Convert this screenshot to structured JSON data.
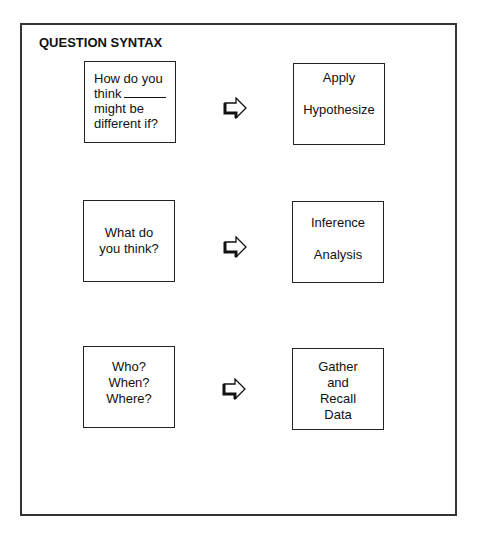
{
  "title": "QUESTION SYNTAX",
  "rows": [
    {
      "question": {
        "lines": [
          "How do you",
          "think",
          "might be",
          "different if?"
        ],
        "blank": "_______"
      },
      "arrow_icon": "outlined-right-arrow",
      "result": {
        "lines": [
          "Apply",
          "Hypothesize"
        ]
      }
    },
    {
      "question": {
        "lines": [
          "What do",
          "you think?"
        ]
      },
      "arrow_icon": "outlined-right-arrow",
      "result": {
        "lines": [
          "Inference",
          "Analysis"
        ]
      }
    },
    {
      "question": {
        "lines": [
          "Who?",
          "When?",
          "Where?"
        ]
      },
      "arrow_icon": "outlined-right-arrow",
      "result": {
        "lines": [
          "Gather",
          "and",
          "Recall",
          "Data"
        ]
      }
    }
  ],
  "colors": {
    "line": "#222222",
    "text": "#111111",
    "background": "#ffffff"
  }
}
